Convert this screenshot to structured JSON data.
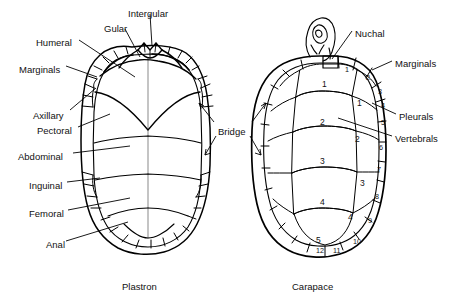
{
  "figure": {
    "background": "#ffffff",
    "ink": "#000000"
  },
  "captions": {
    "left": "Plastron",
    "right": "Carapace"
  },
  "plastron": {
    "name": "Plastron",
    "labels": [
      {
        "id": "intergular",
        "text": "Intergular",
        "x": 128,
        "y": 9,
        "anchor": "start"
      },
      {
        "id": "gular",
        "text": "Gular",
        "x": 104,
        "y": 24,
        "anchor": "start"
      },
      {
        "id": "humeral",
        "text": "Humeral",
        "x": 36,
        "y": 38,
        "anchor": "start"
      },
      {
        "id": "marginals",
        "text": "Marginals",
        "x": 19,
        "y": 65,
        "anchor": "start"
      },
      {
        "id": "axillary",
        "text": "Axillary",
        "x": 33,
        "y": 111,
        "anchor": "start"
      },
      {
        "id": "pectoral",
        "text": "Pectoral",
        "x": 37,
        "y": 126,
        "anchor": "start"
      },
      {
        "id": "abdominal",
        "text": "Abdominal",
        "x": 18,
        "y": 152,
        "anchor": "start"
      },
      {
        "id": "inguinal",
        "text": "Inguinal",
        "x": 29,
        "y": 181,
        "anchor": "start"
      },
      {
        "id": "femoral",
        "text": "Femoral",
        "x": 29,
        "y": 209,
        "anchor": "start"
      },
      {
        "id": "anal",
        "text": "Anal",
        "x": 46,
        "y": 240,
        "anchor": "start"
      }
    ]
  },
  "bridge": {
    "id": "bridge",
    "text": "Bridge",
    "x": 218,
    "y": 127
  },
  "carapace": {
    "name": "Carapace",
    "labels": [
      {
        "id": "nuchal",
        "text": "Nuchal",
        "x": 355,
        "y": 29
      },
      {
        "id": "marginals",
        "text": "Marginals",
        "x": 395,
        "y": 59
      },
      {
        "id": "pleurals",
        "text": "Pleurals",
        "x": 399,
        "y": 112
      },
      {
        "id": "vertebrals",
        "text": "Vertebrals",
        "x": 395,
        "y": 134
      }
    ],
    "vertebrals": [
      {
        "n": "1",
        "x": 322,
        "y": 79
      },
      {
        "n": "2",
        "x": 320,
        "y": 117
      },
      {
        "n": "3",
        "x": 320,
        "y": 156
      },
      {
        "n": "4",
        "x": 320,
        "y": 197
      },
      {
        "n": "5",
        "x": 316,
        "y": 235
      }
    ],
    "pleurals": [
      {
        "n": "1",
        "x": 357,
        "y": 98
      },
      {
        "n": "2",
        "x": 355,
        "y": 134
      },
      {
        "n": "3",
        "x": 360,
        "y": 178
      },
      {
        "n": "4",
        "x": 348,
        "y": 212
      }
    ],
    "marginals": [
      {
        "n": "1",
        "x": 345,
        "y": 65
      },
      {
        "n": "2",
        "x": 366,
        "y": 73
      },
      {
        "n": "3",
        "x": 378,
        "y": 87
      },
      {
        "n": "4",
        "x": 381,
        "y": 101
      },
      {
        "n": "5",
        "x": 381,
        "y": 118
      },
      {
        "n": "6",
        "x": 379,
        "y": 143
      },
      {
        "n": "7",
        "x": 377,
        "y": 165
      },
      {
        "n": "8",
        "x": 375,
        "y": 192
      },
      {
        "n": "9",
        "x": 368,
        "y": 216
      },
      {
        "n": "10",
        "x": 353,
        "y": 237
      },
      {
        "n": "11",
        "x": 333,
        "y": 246
      },
      {
        "n": "12",
        "x": 316,
        "y": 246
      }
    ]
  }
}
